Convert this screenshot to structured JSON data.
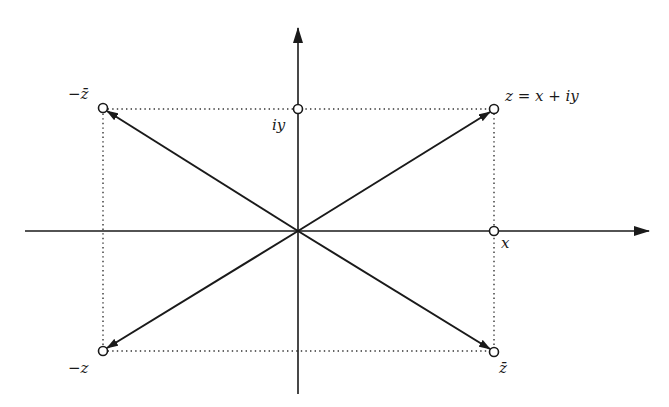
{
  "figure": {
    "colors": {
      "ink": "#1a1a1a",
      "background": "#ffffff"
    },
    "axes": {
      "horizontal": {
        "label": "x"
      },
      "vertical": {
        "label": "iy"
      }
    },
    "points": [
      {
        "id": "z",
        "label": "z = x + iy"
      },
      {
        "id": "minus-z-bar",
        "label": "−z̄"
      },
      {
        "id": "minus-z",
        "label": "−z"
      },
      {
        "id": "z-bar",
        "label": "z̄"
      }
    ],
    "axis_markers": [
      {
        "id": "x-marker",
        "label": "x"
      },
      {
        "id": "iy-marker",
        "label": "iy"
      }
    ]
  }
}
